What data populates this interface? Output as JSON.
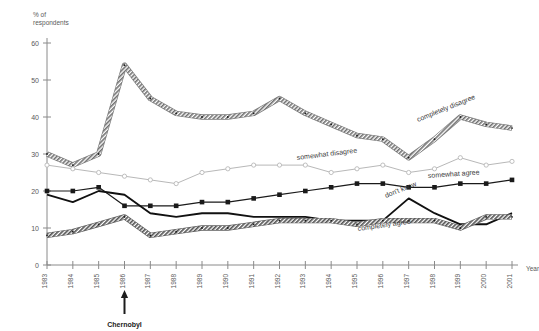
{
  "chart_data": {
    "type": "line",
    "title": "",
    "subtitle": "",
    "xlabel": "Year",
    "ylabel": "% of respondents",
    "ylim": [
      0,
      60
    ],
    "yticks": [
      0,
      10,
      20,
      30,
      40,
      50,
      60
    ],
    "grid": false,
    "legend_position": "inline-labels",
    "x": [
      1983,
      1984,
      1985,
      1986,
      1987,
      1988,
      1989,
      1990,
      1991,
      1992,
      1993,
      1994,
      1995,
      1996,
      1997,
      1998,
      1999,
      2000,
      2001
    ],
    "categories": [
      "1983",
      "1984",
      "1985",
      "1986",
      "1987",
      "1988",
      "1989",
      "1990",
      "1991",
      "1992",
      "1993",
      "1994",
      "1995",
      "1996",
      "1997",
      "1998",
      "1999",
      "2000",
      "2001"
    ],
    "series": [
      {
        "name": "completely disagree",
        "label": "completely disagree",
        "marker": "small-dot",
        "style": "thick-hatched",
        "color": "#7a7a7a",
        "values": [
          30,
          27,
          30,
          54,
          45,
          41,
          40,
          40,
          41,
          45,
          41,
          38,
          35,
          34,
          29,
          34,
          40,
          38,
          37
        ]
      },
      {
        "name": "somewhat disagree",
        "label": "somewhat disagree",
        "marker": "open-circle",
        "style": "thin-light",
        "color": "#b8b8b8",
        "values": [
          27,
          26,
          25,
          24,
          23,
          22,
          25,
          26,
          27,
          27,
          27,
          25,
          26,
          27,
          25,
          26,
          29,
          27,
          28
        ]
      },
      {
        "name": "somewhat agree",
        "label": "somewhat agree",
        "marker": "filled-square",
        "style": "thin-dark",
        "color": "#1a1a1a",
        "values": [
          20,
          20,
          21,
          16,
          16,
          16,
          17,
          17,
          18,
          19,
          20,
          21,
          22,
          22,
          21,
          21,
          22,
          22,
          23
        ]
      },
      {
        "name": "don't know",
        "label": "don't know",
        "marker": "none",
        "style": "medium-dark",
        "color": "#111111",
        "values": [
          19,
          17,
          20,
          19,
          14,
          13,
          14,
          14,
          13,
          13,
          13,
          12,
          12,
          12,
          18,
          14,
          11,
          11,
          14
        ]
      },
      {
        "name": "completely agree",
        "label": "completely agree",
        "marker": "small-dot",
        "style": "thick-hatched",
        "color": "#5e5e5e",
        "values": [
          8,
          9,
          11,
          13,
          8,
          9,
          10,
          10,
          11,
          12,
          12,
          12,
          11,
          12,
          12,
          12,
          10,
          13,
          13
        ]
      }
    ],
    "annotations": [
      {
        "text": "Chernobyl",
        "x": 1986,
        "y": 0,
        "kind": "arrow-up-below-axis"
      }
    ]
  }
}
